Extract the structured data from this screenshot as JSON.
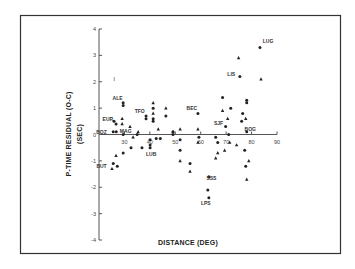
{
  "chart_data": {
    "type": "scatter",
    "title": "",
    "xlabel": "DISTANCE (DEG)",
    "ylabel": "P-TIME RESIDUAL (O-C)",
    "ylabel_unit": "(SEC)",
    "xlim": [
      20,
      90
    ],
    "ylim": [
      -4,
      4
    ],
    "x_ticks": [
      30,
      40,
      50,
      60,
      70,
      80,
      90
    ],
    "y_ticks": [
      4,
      3,
      2,
      1,
      0,
      -1,
      -2,
      -3,
      -4
    ],
    "grid": false,
    "legend": "none",
    "series": [
      {
        "name": "dots",
        "marker": "circle",
        "points": [
          [
            25.6,
            0.1
          ],
          [
            26.8,
            0.1
          ],
          [
            25.6,
            -1.1
          ],
          [
            27.2,
            -1.2
          ],
          [
            29.5,
            1.2
          ],
          [
            29.5,
            1.1
          ],
          [
            25.9,
            0.5
          ],
          [
            26.7,
            0.4
          ],
          [
            29.5,
            -0.7
          ],
          [
            32.6,
            -0.5
          ],
          [
            36.9,
            -0.5
          ],
          [
            29.5,
            0.0
          ],
          [
            35.0,
            0.0
          ],
          [
            38.5,
            0.7
          ],
          [
            38.5,
            0.6
          ],
          [
            40.1,
            -0.2
          ],
          [
            40.1,
            -0.4
          ],
          [
            40.1,
            -0.5
          ],
          [
            41.3,
            1.0
          ],
          [
            41.3,
            0.6
          ],
          [
            41.3,
            0.5
          ],
          [
            42.5,
            -0.15
          ],
          [
            44.1,
            -0.15
          ],
          [
            46.3,
            0.7
          ],
          [
            49.1,
            0.0
          ],
          [
            49.1,
            0.1
          ],
          [
            51.9,
            -0.2
          ],
          [
            51.9,
            -0.6
          ],
          [
            55.8,
            -1.1
          ],
          [
            58.9,
            0.8
          ],
          [
            59.3,
            -0.1
          ],
          [
            63.2,
            -1.6
          ],
          [
            62.8,
            -2.1
          ],
          [
            63.2,
            -2.4
          ],
          [
            65.9,
            -0.1
          ],
          [
            66.7,
            -0.3
          ],
          [
            68.6,
            1.4
          ],
          [
            69.8,
            0.3
          ],
          [
            71.8,
            1.0
          ],
          [
            71.0,
            0.0
          ],
          [
            76.1,
            0.5
          ],
          [
            76.5,
            0.8
          ],
          [
            78.1,
            1.3
          ],
          [
            78.1,
            1.2
          ],
          [
            77.3,
            -0.6
          ],
          [
            77.7,
            -1.2
          ],
          [
            78.1,
            0.1
          ],
          [
            75.4,
            2.2
          ],
          [
            83.3,
            3.3
          ]
        ]
      },
      {
        "name": "triangles",
        "marker": "triangle",
        "points": [
          [
            25.1,
            -1.3
          ],
          [
            26.7,
            -0.8
          ],
          [
            29.1,
            0.4
          ],
          [
            29.1,
            0.6
          ],
          [
            32.2,
            0.3
          ],
          [
            33.4,
            -0.1
          ],
          [
            35.4,
            0.1
          ],
          [
            41.3,
            1.2
          ],
          [
            41.3,
            0.8
          ],
          [
            43.3,
            0.2
          ],
          [
            46.3,
            1.0
          ],
          [
            49.1,
            0.1
          ],
          [
            51.9,
            0.2
          ],
          [
            51.9,
            -1.0
          ],
          [
            58.9,
            0.2
          ],
          [
            58.9,
            -0.3
          ],
          [
            55.8,
            -1.4
          ],
          [
            65.9,
            -0.9
          ],
          [
            66.7,
            -0.7
          ],
          [
            68.6,
            0.9
          ],
          [
            69.4,
            -0.6
          ],
          [
            70.6,
            0.6
          ],
          [
            71.4,
            -0.3
          ],
          [
            74.1,
            -0.4
          ],
          [
            77.7,
            0.6
          ],
          [
            78.9,
            -1.0
          ],
          [
            78.1,
            -1.7
          ],
          [
            74.9,
            2.9
          ],
          [
            83.7,
            2.1
          ]
        ]
      },
      {
        "name": "bars",
        "marker": "tick",
        "points": [
          [
            26.0,
            2.1
          ]
        ]
      }
    ],
    "annotations": [
      {
        "text": "LUG",
        "x": 86.5,
        "y": 3.55
      },
      {
        "text": "LIS",
        "x": 72.0,
        "y": 2.3
      },
      {
        "text": "ALE",
        "x": 27.3,
        "y": 1.4
      },
      {
        "text": "TFO",
        "x": 36.0,
        "y": 0.9
      },
      {
        "text": "EUR",
        "x": 23.5,
        "y": 0.6
      },
      {
        "text": "BOZ",
        "x": 21.0,
        "y": 0.1
      },
      {
        "text": "MAG",
        "x": 30.5,
        "y": 0.15
      },
      {
        "text": "BUT",
        "x": 21.0,
        "y": -1.2
      },
      {
        "text": "LUB",
        "x": 40.5,
        "y": -0.75
      },
      {
        "text": "BEC",
        "x": 56.5,
        "y": 1.0
      },
      {
        "text": "SJF",
        "x": 67.0,
        "y": 0.45
      },
      {
        "text": "BOG",
        "x": 79.5,
        "y": 0.2
      },
      {
        "text": "SSS",
        "x": 64.2,
        "y": -1.65
      },
      {
        "text": "LPS",
        "x": 62.0,
        "y": -2.6
      }
    ]
  },
  "labels": {
    "xlabel": "DISTANCE (DEG)",
    "ylabel": "P-TIME RESIDUAL (O-C)",
    "ylabel_unit": "(SEC)"
  }
}
